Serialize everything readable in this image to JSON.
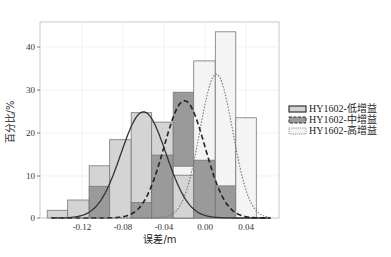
{
  "chart_data": {
    "type": "bar",
    "title": "",
    "xlabel": "误差/m",
    "ylabel": "百分比/%",
    "xlim": [
      -0.15,
      0.065
    ],
    "ylim": [
      0,
      45
    ],
    "xticks": [
      -0.12,
      -0.08,
      -0.04,
      0.0,
      0.04
    ],
    "xtick_labels": [
      "-0.12",
      "-0.08",
      "-0.04",
      "0.00",
      "0.04"
    ],
    "yticks": [
      0,
      10,
      20,
      30,
      40
    ],
    "ytick_labels": [
      "0",
      "10",
      "20",
      "30",
      "40"
    ],
    "grid": true,
    "legend_position": "right",
    "bin_edges": [
      -0.154,
      -0.134,
      -0.113,
      -0.093,
      -0.072,
      -0.052,
      -0.031,
      -0.011,
      0.01,
      0.03,
      0.05
    ],
    "series": [
      {
        "name": "HY1602-低增益",
        "style": "solid",
        "fill": "#d4d4d4",
        "values": [
          1.8,
          4.2,
          12.2,
          18.3,
          24.6,
          22.4,
          10.0,
          0,
          0,
          0
        ],
        "fit": {
          "mean": -0.06,
          "std": 0.022,
          "peak": 24.8
        }
      },
      {
        "name": "HY1602-中增益",
        "style": "dashed",
        "fill": "#9a9a9a",
        "values": [
          0,
          0,
          7.4,
          0,
          3.6,
          14.7,
          29.4,
          13.5,
          7.5,
          0
        ],
        "fit": {
          "mean": -0.02,
          "std": 0.02,
          "peak": 27.4
        }
      },
      {
        "name": "HY1602-高增益",
        "style": "dotted",
        "fill": "#f4f4f4",
        "values": [
          0,
          0,
          0,
          0,
          0,
          0,
          12.1,
          36.7,
          43.5,
          23.4
        ],
        "fit": {
          "mean": 0.011,
          "std": 0.016,
          "peak": 33.6
        }
      }
    ]
  },
  "axis": {
    "xlabel": "误差/m",
    "ylabel": "百分比/%"
  },
  "ticks": {
    "x": [
      "-0.12",
      "-0.08",
      "-0.04",
      "0.00",
      "0.04"
    ],
    "y": [
      "0",
      "10",
      "20",
      "30",
      "40"
    ]
  },
  "legend": [
    {
      "label": "HY1602-低增益"
    },
    {
      "label": "HY1602-中增益"
    },
    {
      "label": "HY1602-高增益"
    }
  ]
}
